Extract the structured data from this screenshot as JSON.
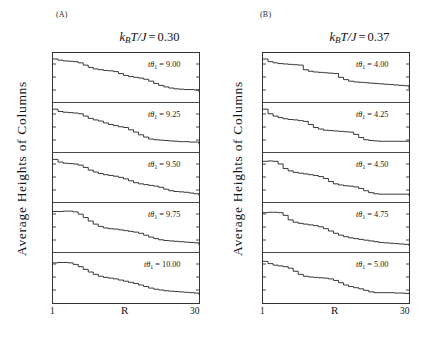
{
  "figure": {
    "yaxis_label": "Average Heights of Columns",
    "xaxis_label": "R",
    "x_tick_min": "1",
    "x_tick_max": "30",
    "line_color": "#222222",
    "axis_color": "#333333",
    "background": "#ffffff"
  },
  "panels": [
    {
      "tag": "(A)",
      "title_prefix": "k",
      "title_sub": "B",
      "title_mid": "T/J",
      "title_eq": "=",
      "title_value": "0.30",
      "temperature": 0.3,
      "subpanels": [
        {
          "label_prefix": "t",
          "label_theta": "θ",
          "label_sub": "1",
          "label_eq": "=",
          "label_value": "9.00"
        },
        {
          "label_prefix": "t",
          "label_theta": "θ",
          "label_sub": "1",
          "label_eq": "=",
          "label_value": "9.25"
        },
        {
          "label_prefix": "t",
          "label_theta": "θ",
          "label_sub": "1",
          "label_eq": "=",
          "label_value": "9.50"
        },
        {
          "label_prefix": "t",
          "label_theta": "θ",
          "label_sub": "1",
          "label_eq": "=",
          "label_value": "9.75"
        },
        {
          "label_prefix": "t",
          "label_theta": "θ",
          "label_sub": "1",
          "label_eq": "=",
          "label_value": "10.00"
        }
      ]
    },
    {
      "tag": "(B)",
      "title_prefix": "k",
      "title_sub": "B",
      "title_mid": "T/J",
      "title_eq": "=",
      "title_value": "0.37",
      "temperature": 0.37,
      "subpanels": [
        {
          "label_prefix": "t",
          "label_theta": "θ",
          "label_sub": "1",
          "label_eq": "=",
          "label_value": "4.00"
        },
        {
          "label_prefix": "t",
          "label_theta": "θ",
          "label_sub": "1",
          "label_eq": "=",
          "label_value": "4.25"
        },
        {
          "label_prefix": "t",
          "label_theta": "θ",
          "label_sub": "1",
          "label_eq": "=",
          "label_value": "4.50"
        },
        {
          "label_prefix": "t",
          "label_theta": "θ",
          "label_sub": "1",
          "label_eq": "=",
          "label_value": "4.75"
        },
        {
          "label_prefix": "t",
          "label_theta": "θ",
          "label_sub": "1",
          "label_eq": "=",
          "label_value": "5.00"
        }
      ]
    }
  ],
  "chart_data": {
    "type": "line",
    "xlabel": "R",
    "ylabel": "Average Heights of Columns",
    "xlim": [
      1,
      30
    ],
    "grid": false,
    "legend": "none",
    "note": "Each of the 10 stacked sub-panels is a monotonically decreasing staircase profile of average column height vs radial index R, for a given deposition time tθ1.",
    "panels": [
      {
        "name": "(A) kBT/J = 0.30",
        "temperature": 0.3,
        "series": [
          {
            "name": "tθ1 = 9.00",
            "x": [
              1,
              2,
              3,
              4,
              5,
              6,
              7,
              8,
              9,
              10,
              11,
              12,
              13,
              14,
              15,
              16,
              17,
              18,
              19,
              20,
              21,
              22,
              23,
              24,
              25,
              26,
              27,
              28,
              29,
              30
            ],
            "values": [
              1.0,
              0.97,
              0.95,
              0.94,
              0.93,
              0.9,
              0.84,
              0.78,
              0.74,
              0.72,
              0.7,
              0.69,
              0.67,
              0.62,
              0.57,
              0.54,
              0.52,
              0.5,
              0.47,
              0.42,
              0.36,
              0.31,
              0.27,
              0.24,
              0.22,
              0.21,
              0.2,
              0.2,
              0.19,
              0.14
            ]
          },
          {
            "name": "tθ1 = 9.25",
            "x": [
              1,
              2,
              3,
              4,
              5,
              6,
              7,
              8,
              9,
              10,
              11,
              12,
              13,
              14,
              15,
              16,
              17,
              18,
              19,
              20,
              21,
              22,
              23,
              24,
              25,
              26,
              27,
              28,
              29,
              30
            ],
            "values": [
              1.0,
              0.94,
              0.92,
              0.91,
              0.9,
              0.88,
              0.82,
              0.76,
              0.72,
              0.69,
              0.64,
              0.6,
              0.57,
              0.54,
              0.52,
              0.46,
              0.4,
              0.33,
              0.27,
              0.22,
              0.2,
              0.19,
              0.18,
              0.17,
              0.16,
              0.15,
              0.15,
              0.14,
              0.14,
              0.08
            ]
          },
          {
            "name": "tθ1 = 9.50",
            "x": [
              1,
              2,
              3,
              4,
              5,
              6,
              7,
              8,
              9,
              10,
              11,
              12,
              13,
              14,
              15,
              16,
              17,
              18,
              19,
              20,
              21,
              22,
              23,
              24,
              25,
              26,
              27,
              28,
              29,
              30
            ],
            "values": [
              1.0,
              0.93,
              0.9,
              0.89,
              0.88,
              0.85,
              0.79,
              0.72,
              0.67,
              0.63,
              0.6,
              0.58,
              0.56,
              0.53,
              0.49,
              0.44,
              0.39,
              0.36,
              0.34,
              0.32,
              0.3,
              0.27,
              0.22,
              0.18,
              0.16,
              0.15,
              0.14,
              0.12,
              0.1,
              0.05
            ]
          },
          {
            "name": "tθ1 = 9.75",
            "x": [
              1,
              2,
              3,
              4,
              5,
              6,
              7,
              8,
              9,
              10,
              11,
              12,
              13,
              14,
              15,
              16,
              17,
              18,
              19,
              20,
              21,
              22,
              23,
              24,
              25,
              26,
              27,
              28,
              29,
              30
            ],
            "values": [
              0.95,
              0.95,
              0.96,
              0.96,
              0.94,
              0.88,
              0.79,
              0.7,
              0.62,
              0.56,
              0.52,
              0.5,
              0.49,
              0.47,
              0.45,
              0.43,
              0.41,
              0.38,
              0.33,
              0.28,
              0.24,
              0.21,
              0.19,
              0.18,
              0.17,
              0.16,
              0.15,
              0.14,
              0.13,
              0.07
            ]
          },
          {
            "name": "tθ1 = 10.00",
            "x": [
              1,
              2,
              3,
              4,
              5,
              6,
              7,
              8,
              9,
              10,
              11,
              12,
              13,
              14,
              15,
              16,
              17,
              18,
              19,
              20,
              21,
              22,
              23,
              24,
              25,
              26,
              27,
              28,
              29,
              30
            ],
            "values": [
              0.92,
              0.93,
              0.93,
              0.92,
              0.88,
              0.82,
              0.75,
              0.68,
              0.62,
              0.57,
              0.54,
              0.52,
              0.5,
              0.47,
              0.44,
              0.41,
              0.38,
              0.34,
              0.3,
              0.26,
              0.23,
              0.21,
              0.19,
              0.18,
              0.17,
              0.16,
              0.15,
              0.14,
              0.13,
              0.08
            ]
          }
        ]
      },
      {
        "name": "(B) kBT/J = 0.37",
        "temperature": 0.37,
        "series": [
          {
            "name": "tθ1 = 4.00",
            "x": [
              1,
              2,
              3,
              4,
              5,
              6,
              7,
              8,
              9,
              10,
              11,
              12,
              13,
              14,
              15,
              16,
              17,
              18,
              19,
              20,
              21,
              22,
              23,
              24,
              25,
              26,
              27,
              28,
              29,
              30
            ],
            "values": [
              1.0,
              0.93,
              0.9,
              0.88,
              0.87,
              0.86,
              0.85,
              0.84,
              0.72,
              0.68,
              0.66,
              0.65,
              0.64,
              0.63,
              0.62,
              0.52,
              0.46,
              0.42,
              0.4,
              0.39,
              0.38,
              0.37,
              0.36,
              0.35,
              0.34,
              0.33,
              0.32,
              0.31,
              0.3,
              0.22
            ]
          },
          {
            "name": "tθ1 = 4.25",
            "x": [
              1,
              2,
              3,
              4,
              5,
              6,
              7,
              8,
              9,
              10,
              11,
              12,
              13,
              14,
              15,
              16,
              17,
              18,
              19,
              20,
              21,
              22,
              23,
              24,
              25,
              26,
              27,
              28,
              29,
              30
            ],
            "values": [
              1.0,
              0.88,
              0.82,
              0.78,
              0.75,
              0.73,
              0.72,
              0.7,
              0.68,
              0.6,
              0.52,
              0.48,
              0.45,
              0.44,
              0.43,
              0.42,
              0.41,
              0.4,
              0.34,
              0.26,
              0.2,
              0.18,
              0.17,
              0.16,
              0.16,
              0.16,
              0.16,
              0.16,
              0.16,
              0.16
            ]
          },
          {
            "name": "tθ1 = 4.50",
            "x": [
              1,
              2,
              3,
              4,
              5,
              6,
              7,
              8,
              9,
              10,
              11,
              12,
              13,
              14,
              15,
              16,
              17,
              18,
              19,
              20,
              21,
              22,
              23,
              24,
              25,
              26,
              27,
              28,
              29,
              30
            ],
            "values": [
              0.95,
              0.96,
              0.95,
              0.88,
              0.76,
              0.7,
              0.66,
              0.64,
              0.62,
              0.6,
              0.58,
              0.55,
              0.5,
              0.42,
              0.36,
              0.33,
              0.31,
              0.3,
              0.28,
              0.24,
              0.18,
              0.13,
              0.1,
              0.09,
              0.09,
              0.09,
              0.09,
              0.09,
              0.09,
              0.05
            ]
          },
          {
            "name": "tθ1 = 4.75",
            "x": [
              1,
              2,
              3,
              4,
              5,
              6,
              7,
              8,
              9,
              10,
              11,
              12,
              13,
              14,
              15,
              16,
              17,
              18,
              19,
              20,
              21,
              22,
              23,
              24,
              25,
              26,
              27,
              28,
              29,
              30
            ],
            "values": [
              0.92,
              0.93,
              0.93,
              0.92,
              0.85,
              0.73,
              0.67,
              0.64,
              0.62,
              0.6,
              0.58,
              0.55,
              0.5,
              0.44,
              0.38,
              0.33,
              0.29,
              0.26,
              0.24,
              0.22,
              0.2,
              0.18,
              0.16,
              0.14,
              0.13,
              0.12,
              0.11,
              0.1,
              0.09,
              0.05
            ]
          },
          {
            "name": "tθ1 = 5.00",
            "x": [
              1,
              2,
              3,
              4,
              5,
              6,
              7,
              8,
              9,
              10,
              11,
              12,
              13,
              14,
              15,
              16,
              17,
              18,
              19,
              20,
              21,
              22,
              23,
              24,
              25,
              26,
              27,
              28,
              29,
              30
            ],
            "values": [
              0.96,
              0.9,
              0.86,
              0.84,
              0.82,
              0.78,
              0.7,
              0.62,
              0.57,
              0.55,
              0.54,
              0.53,
              0.52,
              0.5,
              0.46,
              0.4,
              0.34,
              0.3,
              0.27,
              0.24,
              0.2,
              0.16,
              0.14,
              0.14,
              0.14,
              0.14,
              0.13,
              0.13,
              0.12,
              0.1
            ]
          }
        ]
      }
    ]
  }
}
